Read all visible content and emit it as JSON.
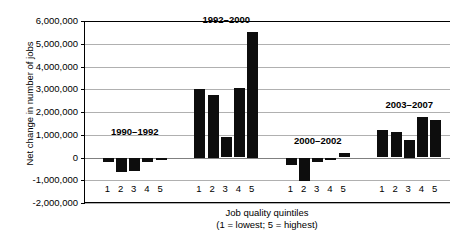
{
  "chart_data": {
    "type": "bar",
    "title": "",
    "xlabel": "Job quality quintiles",
    "xlabel_sub": "(1 = lowest; 5 = highest)",
    "ylabel": "Net change in number of jobs",
    "ylim": [
      -2000000,
      6000000
    ],
    "ytick_step": 1000000,
    "ytick_labels": [
      "6,000,000",
      "5,000,000",
      "4,000,000",
      "3,000,000",
      "2,000,000",
      "1,000,000",
      "0",
      "-1,000,000",
      "-2,000,000"
    ],
    "ytick_values": [
      6000000,
      5000000,
      4000000,
      3000000,
      2000000,
      1000000,
      0,
      -1000000,
      -2000000
    ],
    "grid": true,
    "legend": "none",
    "bar_color": "#0d0d0d",
    "categories": [
      "1",
      "2",
      "3",
      "4",
      "5"
    ],
    "groups": [
      {
        "name": "1990-1992",
        "label": "1990–1992",
        "categories": [
          "1",
          "2",
          "3",
          "4",
          "5"
        ],
        "values": [
          -200000,
          -620000,
          -610000,
          -180000,
          -130000
        ]
      },
      {
        "name": "1992-2000",
        "label": "1992–2000",
        "categories": [
          "1",
          "2",
          "3",
          "4",
          "5"
        ],
        "values": [
          3000000,
          2750000,
          900000,
          3050000,
          5500000
        ]
      },
      {
        "name": "2000-2002",
        "label": "2000–2002",
        "categories": [
          "1",
          "2",
          "3",
          "4",
          "5"
        ],
        "values": [
          -320000,
          -1050000,
          -200000,
          -90000,
          210000
        ]
      },
      {
        "name": "2003-2007",
        "label": "2003–2007",
        "categories": [
          "1",
          "2",
          "3",
          "4",
          "5"
        ],
        "values": [
          1200000,
          1100000,
          750000,
          1800000,
          1650000
        ]
      }
    ]
  }
}
